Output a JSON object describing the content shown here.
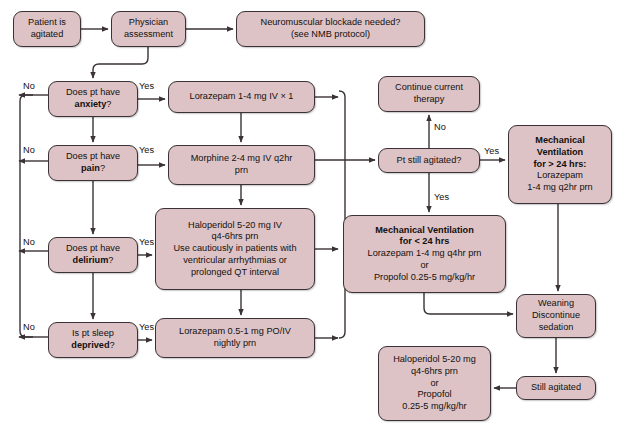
{
  "diagram": {
    "type": "flowchart",
    "colors": {
      "node_fill": "#ddc3c5",
      "node_border": "#3a3236",
      "edge": "#3a3236",
      "text": "#14100f",
      "background": "#ffffff"
    },
    "nodes": [
      {
        "id": "patient_agitated",
        "label": "Patient is\nagitated",
        "x": 13,
        "y": 11,
        "w": 68,
        "h": 36
      },
      {
        "id": "physician_assessment",
        "label": "Physician\nassessment",
        "x": 111,
        "y": 11,
        "w": 75,
        "h": 36
      },
      {
        "id": "nmb",
        "label": "Neuromuscular blockade needed?\n(see NMB protocol)",
        "x": 236,
        "y": 11,
        "w": 189,
        "h": 36
      },
      {
        "id": "q_anxiety",
        "label": "Does pt have\n<b>anxiety</b>?",
        "x": 48,
        "y": 81,
        "w": 90,
        "h": 36
      },
      {
        "id": "q_pain",
        "label": "Does pt have\n<b>pain</b>?",
        "x": 48,
        "y": 145,
        "w": 90,
        "h": 36
      },
      {
        "id": "q_delirium",
        "label": "Does pt have\n<b>delirium</b>?",
        "x": 48,
        "y": 237,
        "w": 90,
        "h": 36
      },
      {
        "id": "q_sleep",
        "label": "Is pt sleep\n<b>deprived</b>?",
        "x": 48,
        "y": 322,
        "w": 90,
        "h": 36
      },
      {
        "id": "rx_lorazepam1",
        "label": "Lorazepam 1-4 mg IV × 1",
        "x": 168,
        "y": 81,
        "w": 147,
        "h": 32
      },
      {
        "id": "rx_morphine",
        "label": "Morphine 2-4 mg IV q2hr\nprn",
        "x": 168,
        "y": 145,
        "w": 147,
        "h": 40
      },
      {
        "id": "rx_haloperidol",
        "label": "Haloperidol 5-20 mg IV\nq4-6hrs prn\nUse cautiously in patients with\nventricular arrhythmias or\nprolonged QT interval",
        "x": 155,
        "y": 208,
        "w": 160,
        "h": 82
      },
      {
        "id": "rx_lorazepam2",
        "label": "Lorazepam 0.5-1 mg PO/IV\nnightly prn",
        "x": 155,
        "y": 318,
        "w": 160,
        "h": 40
      },
      {
        "id": "continue_therapy",
        "label": "Continue current\ntherapy",
        "x": 378,
        "y": 76,
        "w": 102,
        "h": 36
      },
      {
        "id": "q_still_agitated",
        "label": "Pt still agitated?",
        "x": 378,
        "y": 148,
        "w": 102,
        "h": 25
      },
      {
        "id": "mv_gt24",
        "label": "<b>Mechanical\nVentilation\nfor > 24 hrs:</b>\nLorazepam\n1-4 mg q2hr prn",
        "x": 508,
        "y": 125,
        "w": 104,
        "h": 79
      },
      {
        "id": "mv_lt24",
        "label": "<b>Mechanical Ventilation\nfor < 24 hrs</b>\nLorazepam 1-4 mg q4hr prn\nor\nPropofol 0.25-5 mg/kg/hr",
        "x": 343,
        "y": 215,
        "w": 163,
        "h": 78
      },
      {
        "id": "weaning",
        "label": "Weaning\nDiscontinue\nsedation",
        "x": 516,
        "y": 294,
        "w": 80,
        "h": 44
      },
      {
        "id": "still_agitated",
        "label": "Still agitated",
        "x": 516,
        "y": 376,
        "w": 80,
        "h": 24
      },
      {
        "id": "rx_haloperidol2",
        "label": "Haloperidol 5-20 mg\nq4-6hrs prn\nor\nPropofol\n0.25-5 mg/kg/hr",
        "x": 378,
        "y": 346,
        "w": 113,
        "h": 75
      }
    ],
    "edge_labels": [
      {
        "id": "lbl_no_anxiety",
        "text": "No",
        "x": 23,
        "y": 81
      },
      {
        "id": "lbl_yes_anxiety",
        "text": "Yes",
        "x": 139,
        "y": 81
      },
      {
        "id": "lbl_no_pain",
        "text": "No",
        "x": 23,
        "y": 145
      },
      {
        "id": "lbl_yes_pain",
        "text": "Yes",
        "x": 139,
        "y": 145
      },
      {
        "id": "lbl_no_delirium",
        "text": "No",
        "x": 23,
        "y": 237
      },
      {
        "id": "lbl_yes_delirium",
        "text": "Yes",
        "x": 139,
        "y": 237
      },
      {
        "id": "lbl_no_sleep",
        "text": "No",
        "x": 23,
        "y": 322
      },
      {
        "id": "lbl_yes_sleep",
        "text": "Yes",
        "x": 139,
        "y": 322
      },
      {
        "id": "lbl_no_agitated",
        "text": "No",
        "x": 434,
        "y": 122
      },
      {
        "id": "lbl_yes_agitated_right",
        "text": "Yes",
        "x": 484,
        "y": 146
      },
      {
        "id": "lbl_yes_agitated_down",
        "text": "Yes",
        "x": 434,
        "y": 192
      }
    ]
  }
}
